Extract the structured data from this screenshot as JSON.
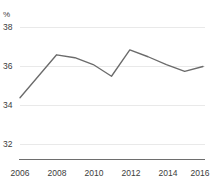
{
  "chart_data": {
    "type": "line",
    "title": "",
    "subtitle": "",
    "xlabel": "",
    "ylabel": "%",
    "unit_label": "%",
    "x": [
      2006,
      2007,
      2008,
      2009,
      2010,
      2011,
      2012,
      2013,
      2014,
      2015,
      2016
    ],
    "series": [
      {
        "name": "",
        "values": [
          34.4,
          35.5,
          36.6,
          36.45,
          36.1,
          35.5,
          36.85,
          36.5,
          36.1,
          35.75,
          36.0
        ]
      }
    ],
    "x_tick_labels": [
      "2006",
      "2008",
      "2010",
      "2012",
      "2014",
      "2016"
    ],
    "x_tick_values": [
      2006,
      2008,
      2010,
      2012,
      2014,
      2016
    ],
    "y_tick_labels": [
      "32",
      "34",
      "36",
      "38"
    ],
    "y_tick_values": [
      32,
      34,
      36,
      38
    ],
    "xlim": [
      2006,
      2016
    ],
    "ylim": [
      31.2,
      38.6
    ],
    "grid": true,
    "grid_axis": "y",
    "legend": false,
    "legend_position": "none",
    "line_color": "#6b6b6b",
    "grid_color": "#e9e9e9",
    "axis_color": "#6e6e6e",
    "text_color": "#3c3c3c"
  },
  "axes": {
    "y_unit": "%",
    "y_ticks": [
      {
        "label": "38",
        "value": 38
      },
      {
        "label": "36",
        "value": 36
      },
      {
        "label": "34",
        "value": 34
      },
      {
        "label": "32",
        "value": 32
      }
    ],
    "x_ticks": [
      {
        "label": "2006",
        "value": 2006
      },
      {
        "label": "2008",
        "value": 2008
      },
      {
        "label": "2010",
        "value": 2010
      },
      {
        "label": "2012",
        "value": 2012
      },
      {
        "label": "2014",
        "value": 2014
      },
      {
        "label": "2016",
        "value": 2016
      }
    ]
  }
}
